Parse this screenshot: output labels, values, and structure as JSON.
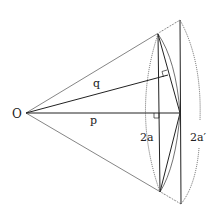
{
  "diagram": {
    "type": "geometry",
    "labels": {
      "origin": "O",
      "q": "q",
      "p": "p",
      "chord_inner": "2a",
      "chord_outer": "2a′"
    },
    "points": {
      "O": [
        26,
        113
      ],
      "inner_top": [
        158,
        34
      ],
      "inner_bottom": [
        160,
        192
      ],
      "outer_top": [
        180,
        20
      ],
      "outer_bottom": [
        181,
        204
      ],
      "apex": [
        180,
        113
      ],
      "q_foot": [
        168,
        75
      ],
      "p_foot": [
        159,
        113
      ]
    },
    "colors": {
      "stroke": "#222222",
      "background": "#ffffff"
    }
  }
}
